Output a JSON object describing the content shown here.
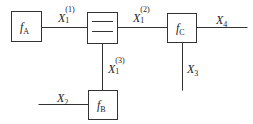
{
  "diagram": {
    "type": "block-diagram",
    "blocks": [
      {
        "id": "fA",
        "label": "f",
        "subscript": "A"
      },
      {
        "id": "splitter",
        "label": "",
        "description": "splitter node with two horizontal lines"
      },
      {
        "id": "fC",
        "label": "f",
        "subscript": "C"
      },
      {
        "id": "fB",
        "label": "f",
        "subscript": "B"
      }
    ],
    "signals": [
      {
        "id": "X1_1",
        "label": "X",
        "subscript": "1",
        "superscript": "(1)",
        "from": "fA",
        "to": "splitter"
      },
      {
        "id": "X1_2",
        "label": "X",
        "subscript": "1",
        "superscript": "(2)",
        "from": "splitter",
        "to": "fC"
      },
      {
        "id": "X1_3",
        "label": "X",
        "subscript": "1",
        "superscript": "(3)",
        "from": "splitter",
        "to": "fB"
      },
      {
        "id": "X2",
        "label": "X",
        "subscript": "2",
        "from": "input",
        "to": "fB"
      },
      {
        "id": "X3",
        "label": "X",
        "subscript": "3",
        "from": "fC",
        "to": "output"
      },
      {
        "id": "X4",
        "label": "X",
        "subscript": "4",
        "from": "fC",
        "to": "output"
      }
    ],
    "colors": {
      "line": "#333333",
      "background": "#ffffff"
    }
  }
}
